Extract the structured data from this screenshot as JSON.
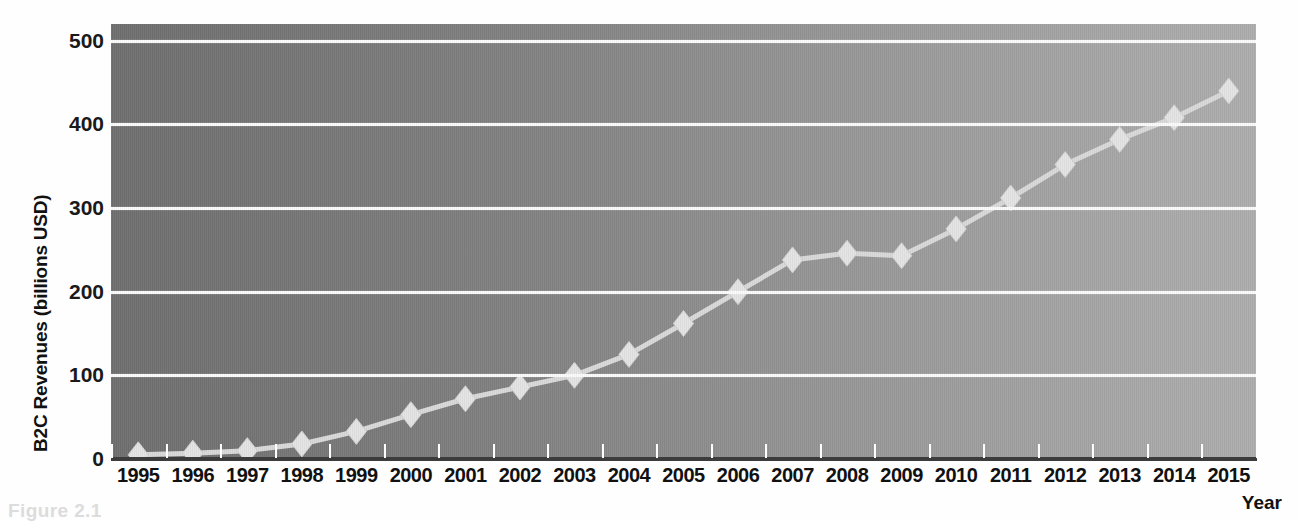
{
  "chart_data": {
    "type": "line",
    "title": "",
    "xlabel": "Year",
    "ylabel": "B2C Revenues (billions USD)",
    "categories": [
      "1995",
      "1996",
      "1997",
      "1998",
      "1999",
      "2000",
      "2001",
      "2002",
      "2003",
      "2004",
      "2005",
      "2006",
      "2007",
      "2008",
      "2009",
      "2010",
      "2011",
      "2012",
      "2013",
      "2014",
      "2015"
    ],
    "values": [
      5,
      7,
      10,
      18,
      33,
      53,
      72,
      86,
      100,
      125,
      162,
      200,
      238,
      246,
      243,
      275,
      312,
      352,
      382,
      408,
      440
    ],
    "ylim": [
      0,
      520
    ],
    "yticks": [
      0,
      100,
      200,
      300,
      400,
      500
    ],
    "ytick_labels": [
      "0",
      "100",
      "200",
      "300",
      "400",
      "500"
    ],
    "grid": true,
    "legend": false,
    "marker": "diamond",
    "series_name": "B2C Revenues",
    "colors": {
      "plot_background_left": "#6f6f6f",
      "plot_background_right": "#adadad",
      "gridline": "#fbfbfb",
      "line": "#d9d9d9",
      "marker": "#e4e4e4",
      "axis": "#3c3c3c",
      "text": "#111111"
    }
  },
  "caption": "Figure 2.1"
}
